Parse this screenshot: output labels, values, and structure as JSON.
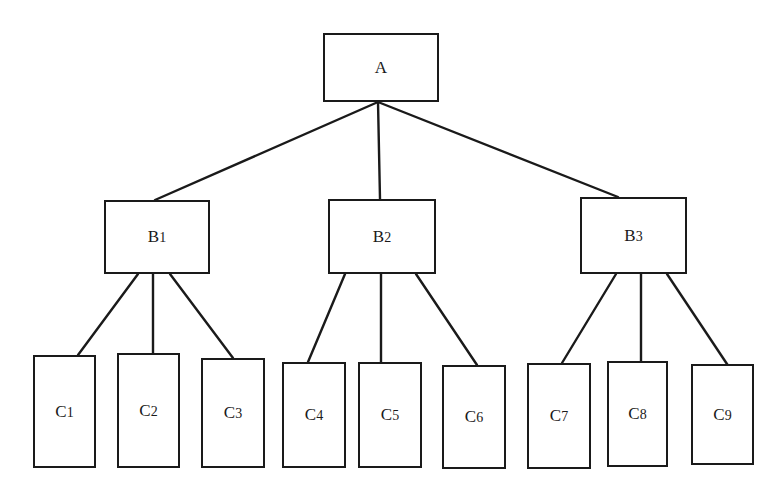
{
  "diagram": {
    "type": "tree",
    "nodes": [
      {
        "id": "A",
        "label": "A",
        "sub": "",
        "x": 323,
        "y": 33,
        "w": 116,
        "h": 69
      },
      {
        "id": "B1",
        "label": "B",
        "sub": "1",
        "x": 104,
        "y": 200,
        "w": 106,
        "h": 74
      },
      {
        "id": "B2",
        "label": "B",
        "sub": "2",
        "x": 328,
        "y": 199,
        "w": 108,
        "h": 75
      },
      {
        "id": "B3",
        "label": "B",
        "sub": "3",
        "x": 580,
        "y": 197,
        "w": 107,
        "h": 77
      },
      {
        "id": "C1",
        "label": "C",
        "sub": "1",
        "x": 33,
        "y": 355,
        "w": 63,
        "h": 113
      },
      {
        "id": "C2",
        "label": "C",
        "sub": "2",
        "x": 117,
        "y": 353,
        "w": 63,
        "h": 115
      },
      {
        "id": "C3",
        "label": "C",
        "sub": "3",
        "x": 201,
        "y": 358,
        "w": 64,
        "h": 110
      },
      {
        "id": "C4",
        "label": "C",
        "sub": "4",
        "x": 282,
        "y": 362,
        "w": 64,
        "h": 106
      },
      {
        "id": "C5",
        "label": "C",
        "sub": "5",
        "x": 358,
        "y": 362,
        "w": 64,
        "h": 106
      },
      {
        "id": "C6",
        "label": "C",
        "sub": "6",
        "x": 442,
        "y": 365,
        "w": 64,
        "h": 104
      },
      {
        "id": "C7",
        "label": "C",
        "sub": "7",
        "x": 527,
        "y": 363,
        "w": 64,
        "h": 106
      },
      {
        "id": "C8",
        "label": "C",
        "sub": "8",
        "x": 607,
        "y": 361,
        "w": 61,
        "h": 106
      },
      {
        "id": "C9",
        "label": "C",
        "sub": "9",
        "x": 691,
        "y": 364,
        "w": 63,
        "h": 101
      }
    ],
    "edges": [
      {
        "from": "A",
        "to": "B1",
        "x1": 378,
        "y1": 102,
        "x2": 155,
        "y2": 200
      },
      {
        "from": "A",
        "to": "B2",
        "x1": 378,
        "y1": 102,
        "x2": 380,
        "y2": 199
      },
      {
        "from": "A",
        "to": "B3",
        "x1": 378,
        "y1": 102,
        "x2": 618,
        "y2": 197
      },
      {
        "from": "B1",
        "to": "C1",
        "x1": 138,
        "y1": 274,
        "x2": 78,
        "y2": 355
      },
      {
        "from": "B1",
        "to": "C2",
        "x1": 153,
        "y1": 274,
        "x2": 153,
        "y2": 353
      },
      {
        "from": "B1",
        "to": "C3",
        "x1": 170,
        "y1": 274,
        "x2": 233,
        "y2": 358
      },
      {
        "from": "B2",
        "to": "C4",
        "x1": 345,
        "y1": 274,
        "x2": 308,
        "y2": 362
      },
      {
        "from": "B2",
        "to": "C5",
        "x1": 381,
        "y1": 274,
        "x2": 381,
        "y2": 362
      },
      {
        "from": "B2",
        "to": "C6",
        "x1": 416,
        "y1": 274,
        "x2": 477,
        "y2": 365
      },
      {
        "from": "B3",
        "to": "C7",
        "x1": 616,
        "y1": 274,
        "x2": 562,
        "y2": 363
      },
      {
        "from": "B3",
        "to": "C8",
        "x1": 641,
        "y1": 274,
        "x2": 641,
        "y2": 361
      },
      {
        "from": "B3",
        "to": "C9",
        "x1": 667,
        "y1": 274,
        "x2": 727,
        "y2": 364
      }
    ],
    "colors": {
      "stroke": "#1a1a1a",
      "background": "#ffffff"
    }
  }
}
